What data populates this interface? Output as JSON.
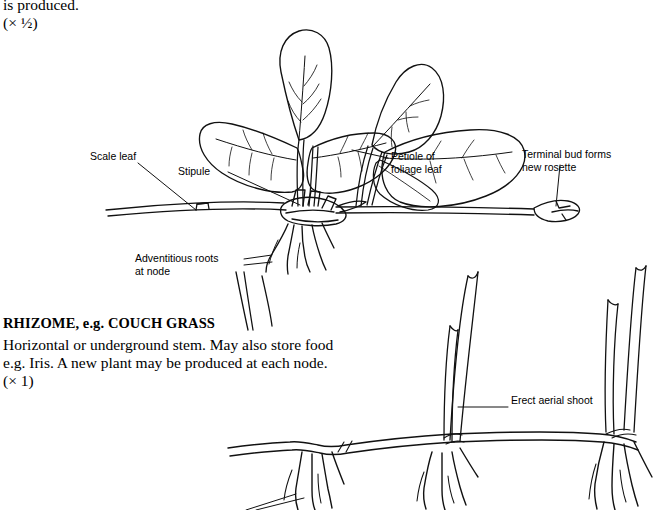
{
  "figure": {
    "top_text": {
      "continuation": "is produced.",
      "scale": "(× ½)"
    },
    "runner_labels": {
      "scale_leaf": "Scale leaf",
      "stipule": "Stipule",
      "petiole": "Petiole of\nfoliage leaf",
      "terminal_bud": "Terminal bud forms\nnew rosette",
      "adventitious_roots": "Adventitious roots\nat node"
    },
    "rhizome_section": {
      "heading": "RHIZOME, e.g. COUCH GRASS",
      "body_line1": "Horizontal or underground stem. May also store food",
      "body_line2": "e.g. Iris. A new plant may be produced at each node.",
      "scale": "(× 1)",
      "label_shoot": "Erect aerial shoot"
    },
    "colors": {
      "ink": "#111111",
      "paper": "#ffffff"
    }
  }
}
